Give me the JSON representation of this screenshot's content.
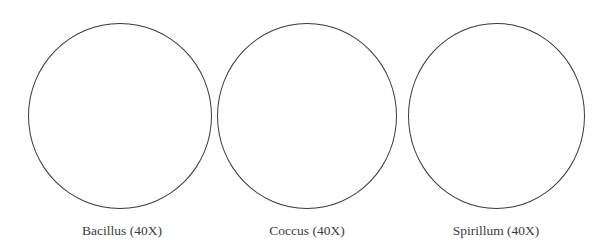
{
  "diagram": {
    "stroke_color": "#3a3a3a",
    "text_color": "#3c3c3c",
    "fields": [
      {
        "label": "Bacillus (40X)",
        "cx": 120,
        "cy": 116,
        "rx": 92,
        "ry": 93
      },
      {
        "label": "Coccus (40X)",
        "cx": 307,
        "cy": 116,
        "rx": 90,
        "ry": 93
      },
      {
        "label": "Spirillum (40X)",
        "cx": 496,
        "cy": 116,
        "rx": 88,
        "ry": 93
      }
    ]
  }
}
